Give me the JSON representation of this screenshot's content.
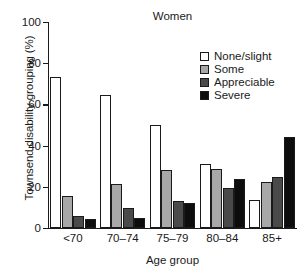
{
  "chart_data": {
    "type": "bar",
    "title": "Women",
    "xlabel": "Age group",
    "ylabel": "Townsend disability grouping (%)",
    "categories": [
      "<70",
      "70–74",
      "75–79",
      "80–84",
      "85+"
    ],
    "series": [
      {
        "name": "None/slight",
        "color": "#ffffff",
        "values": [
          73.5,
          64.5,
          50.0,
          31.0,
          13.5
        ]
      },
      {
        "name": "Some",
        "color": "#a8a8a8",
        "values": [
          15.5,
          21.5,
          28.0,
          28.5,
          22.5
        ]
      },
      {
        "name": "Appreciable",
        "color": "#4a4a4a",
        "values": [
          6.0,
          9.5,
          13.0,
          19.5,
          25.0
        ]
      },
      {
        "name": "Severe",
        "color": "#0d0d0d",
        "values": [
          4.5,
          5.0,
          12.0,
          24.0,
          44.0
        ]
      }
    ],
    "ylim": [
      0,
      100
    ],
    "yticks": [
      0,
      20,
      40,
      60,
      80,
      100
    ],
    "ytick_labels": [
      "0",
      "20",
      "40",
      "60",
      "80",
      "100"
    ],
    "grid": false,
    "legend_position": "top-right",
    "axis_color": "#1a1a1a"
  }
}
